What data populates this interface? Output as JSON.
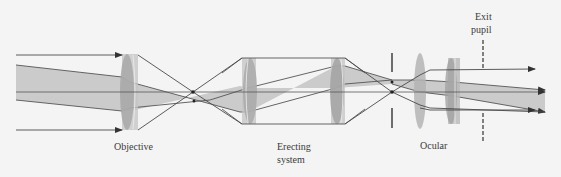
{
  "diagram": {
    "colors": {
      "background": "#f4f4f4",
      "ray": "#4a4a4a",
      "beam_fill": "#c9c9c9",
      "lens_fill": "#b0b0b0",
      "lens_dark": "#9a9a9a",
      "stop": "#3a3a3a"
    },
    "labels": {
      "objective": "Objective",
      "erecting_line1": "Erecting",
      "erecting_line2": "system",
      "ocular": "Ocular",
      "exit_line1": "Exit",
      "exit_line2": "pupil"
    },
    "components": [
      {
        "name": "Objective",
        "type": "lens",
        "x": 130
      },
      {
        "name": "Erecting system lens 1",
        "type": "lens",
        "x": 248
      },
      {
        "name": "Erecting system lens 2",
        "type": "lens",
        "x": 336
      },
      {
        "name": "Field stop",
        "type": "stop",
        "x": 392
      },
      {
        "name": "Ocular field lens",
        "type": "lens",
        "x": 420
      },
      {
        "name": "Ocular eye lens (doublet)",
        "type": "lens",
        "x": 453
      },
      {
        "name": "Exit pupil",
        "type": "dashed-stop",
        "x": 483
      }
    ]
  }
}
